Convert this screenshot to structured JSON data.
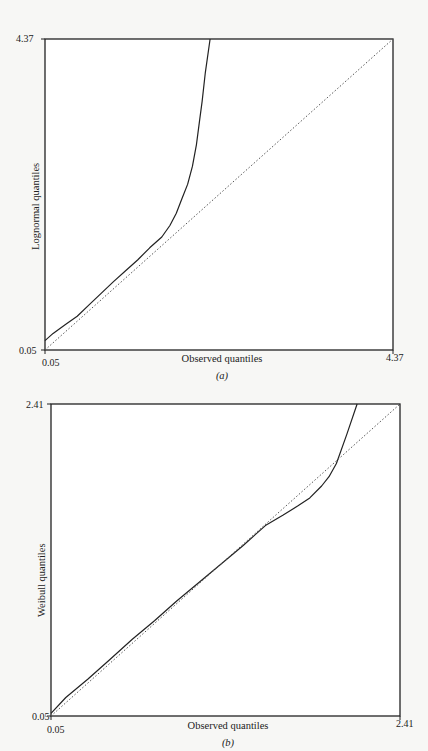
{
  "chart_data": [
    {
      "id": "a",
      "type": "line",
      "title": "",
      "caption": "(a)",
      "xlabel": "Observed quantiles",
      "ylabel": "Lognormal quantiles",
      "xlim": [
        0.05,
        4.37
      ],
      "ylim": [
        0.05,
        4.37
      ],
      "x_ticks": [
        "0.05",
        "4.37"
      ],
      "y_ticks": [
        "0.05",
        "4.37"
      ],
      "grid": false,
      "legend": null,
      "series": [
        {
          "name": "Q-Q curve",
          "style": "solid",
          "x": [
            0.05,
            0.15,
            0.3,
            0.45,
            0.6,
            0.75,
            0.9,
            1.05,
            1.2,
            1.35,
            1.5,
            1.6,
            1.68,
            1.75,
            1.82,
            1.88,
            1.93,
            1.97,
            2.0,
            2.04,
            2.1
          ],
          "y": [
            0.18,
            0.28,
            0.4,
            0.52,
            0.68,
            0.84,
            1.0,
            1.15,
            1.3,
            1.47,
            1.62,
            1.78,
            1.95,
            2.15,
            2.35,
            2.6,
            2.9,
            3.25,
            3.5,
            3.9,
            4.37
          ]
        },
        {
          "name": "Reference line (y = x)",
          "style": "dotted",
          "x": [
            0.05,
            4.37
          ],
          "y": [
            0.05,
            4.37
          ]
        }
      ]
    },
    {
      "id": "b",
      "type": "line",
      "title": "",
      "caption": "(b)",
      "xlabel": "Observed quantiles",
      "ylabel": "Weibull quantiles",
      "xlim": [
        0.05,
        2.41
      ],
      "ylim": [
        0.05,
        2.41
      ],
      "x_ticks": [
        "0.05",
        "2.41"
      ],
      "y_ticks": [
        "0.05",
        "2.41"
      ],
      "grid": false,
      "legend": null,
      "series": [
        {
          "name": "Q-Q curve",
          "style": "solid",
          "x": [
            0.05,
            0.15,
            0.3,
            0.45,
            0.6,
            0.75,
            0.9,
            1.05,
            1.2,
            1.35,
            1.5,
            1.62,
            1.72,
            1.8,
            1.88,
            1.93,
            1.98,
            2.05,
            2.12
          ],
          "y": [
            0.07,
            0.19,
            0.33,
            0.48,
            0.63,
            0.77,
            0.92,
            1.06,
            1.2,
            1.34,
            1.49,
            1.57,
            1.64,
            1.7,
            1.79,
            1.86,
            1.96,
            2.18,
            2.41
          ]
        },
        {
          "name": "Reference line (y = x)",
          "style": "dotted",
          "x": [
            0.05,
            2.41
          ],
          "y": [
            0.05,
            2.41
          ]
        }
      ]
    }
  ]
}
